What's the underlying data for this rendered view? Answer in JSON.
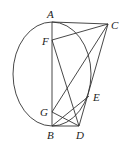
{
  "diagram": {
    "points": {
      "A": {
        "label": "A",
        "x": 52,
        "y": 22
      },
      "C": {
        "label": "C",
        "x": 108,
        "y": 24
      },
      "F": {
        "label": "F",
        "x": 52,
        "y": 40
      },
      "G": {
        "label": "G",
        "x": 52,
        "y": 112
      },
      "B": {
        "label": "B",
        "x": 52,
        "y": 126
      },
      "D": {
        "label": "D",
        "x": 79,
        "y": 126
      },
      "E": {
        "label": "E",
        "x": 89,
        "y": 96
      }
    },
    "segments": [
      [
        "A",
        "C"
      ],
      [
        "F",
        "C"
      ],
      [
        "A",
        "B"
      ],
      [
        "C",
        "G"
      ],
      [
        "C",
        "D"
      ],
      [
        "F",
        "D"
      ],
      [
        "G",
        "D"
      ],
      [
        "B",
        "D"
      ],
      [
        "B",
        "E"
      ]
    ],
    "ellipse": {
      "cx": 52,
      "cy": 74,
      "rx": 39,
      "ry": 52
    },
    "stroke_color": "#333333"
  }
}
